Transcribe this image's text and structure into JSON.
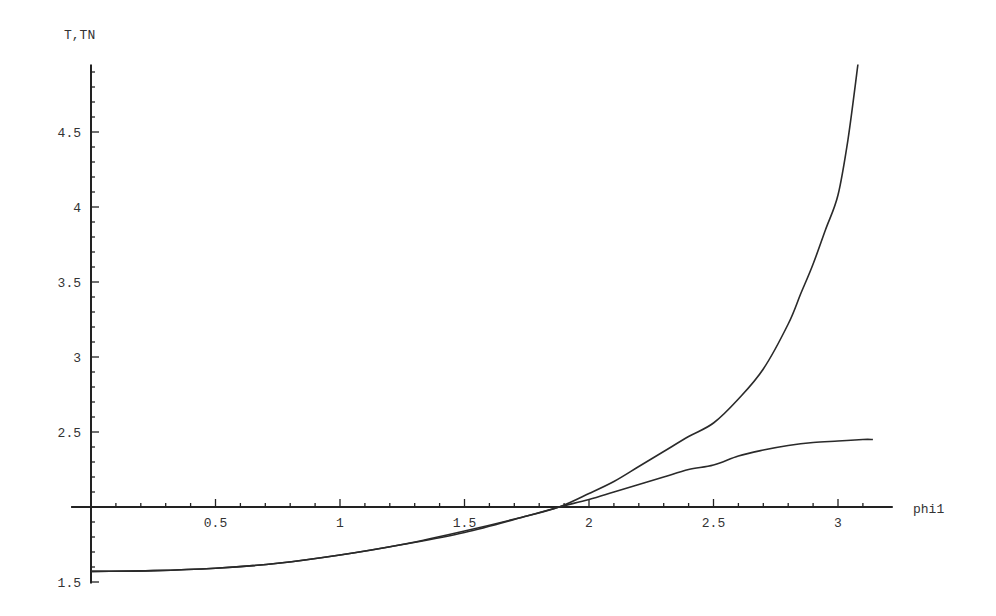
{
  "chart_data": {
    "type": "line",
    "title": "",
    "xlabel": "phi1",
    "ylabel": "T,TN",
    "xlim": [
      -0.08,
      3.22
    ],
    "ylim": [
      1.49,
      4.95
    ],
    "axis_origin": {
      "x": 0,
      "y": 2.0
    },
    "grid": false,
    "legend": null,
    "x_ticks": [
      0.5,
      1,
      1.5,
      2,
      2.5,
      3
    ],
    "x_tick_labels": [
      "0.5",
      "1",
      "1.5",
      "2",
      "2.5",
      "3"
    ],
    "y_ticks": [
      1.5,
      2.5,
      3,
      3.5,
      4,
      4.5
    ],
    "y_tick_labels": [
      "1.5",
      "2.5",
      "3",
      "3.5",
      "4",
      "4.5"
    ],
    "minor_tick_step": {
      "x": 0.1,
      "y": 0.1
    },
    "series": [
      {
        "name": "T",
        "x": [
          0,
          0.25,
          0.5,
          0.75,
          1.0,
          1.25,
          1.5,
          1.75,
          1.88,
          2.0,
          2.1,
          2.2,
          2.3,
          2.4,
          2.5,
          2.6,
          2.7,
          2.8,
          2.85,
          2.9,
          2.95,
          3.0,
          3.04,
          3.08
        ],
        "values": [
          1.571,
          1.576,
          1.592,
          1.625,
          1.68,
          1.75,
          1.84,
          1.94,
          2.0,
          2.09,
          2.17,
          2.27,
          2.37,
          2.47,
          2.56,
          2.72,
          2.92,
          3.22,
          3.42,
          3.62,
          3.85,
          4.08,
          4.45,
          4.95
        ]
      },
      {
        "name": "TN",
        "x": [
          0,
          0.25,
          0.5,
          0.75,
          1.0,
          1.25,
          1.5,
          1.75,
          1.88,
          2.0,
          2.1,
          2.2,
          2.3,
          2.4,
          2.5,
          2.6,
          2.7,
          2.8,
          2.9,
          3.0,
          3.1,
          3.14
        ],
        "values": [
          1.571,
          1.576,
          1.592,
          1.625,
          1.68,
          1.75,
          1.83,
          1.94,
          2.0,
          2.05,
          2.1,
          2.15,
          2.2,
          2.25,
          2.28,
          2.34,
          2.38,
          2.41,
          2.43,
          2.44,
          2.45,
          2.45
        ]
      }
    ]
  }
}
